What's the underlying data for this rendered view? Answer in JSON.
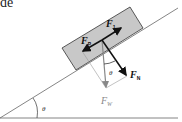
{
  "diagram": {
    "title_fragment": "de",
    "type": "inclined-plane free-body diagram",
    "colors": {
      "block_fill": "#c8c8c8",
      "block_stroke": "#333333",
      "line": "#555555",
      "arrow_dark": "#111111",
      "arrow_gray": "#888888",
      "label_dark": "#111111",
      "label_gray": "#888888"
    },
    "labels": {
      "f1": {
        "main": "F",
        "sub": "1"
      },
      "fp": {
        "main": "F",
        "sub": "P"
      },
      "fn": {
        "main": "F",
        "sub": "N"
      },
      "fw": {
        "main": "F",
        "sub": "W"
      },
      "theta_force": "θ",
      "theta_incline": "θ"
    }
  }
}
